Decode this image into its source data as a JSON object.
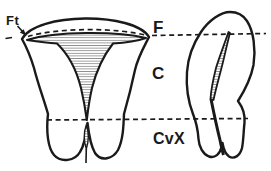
{
  "diagram": {
    "labels": {
      "fallopian_tube": "Ft",
      "fundus": "F",
      "corpus": "C",
      "cervix": "CvX"
    },
    "colors": {
      "ink": "#1a1a1a",
      "paper": "#ffffff",
      "hatch": "#8f8f8f"
    }
  }
}
